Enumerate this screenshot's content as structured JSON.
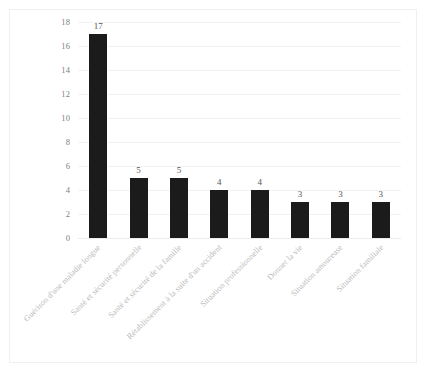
{
  "chart_data": {
    "type": "bar",
    "title": "",
    "subtitle": "",
    "xlabel": "",
    "ylabel": "",
    "ylim": [
      0,
      18
    ],
    "ytick_step": 2,
    "grid": true,
    "legend": false,
    "legend_position": "none",
    "bar_color": "#1b1b1b",
    "gridline_color": "#f2f2f2",
    "tick_label_color": "#808080",
    "category_label_color": "#b9b9b9",
    "category_label_rotation": -45,
    "value_labels_shown": true,
    "categories": [
      "Guérison d'une maladie longue",
      "Santé et sécurité personnelle",
      "Santé et sécurité de la famille",
      "Rétablissement à la suite d'un accident",
      "Situation professionnelle",
      "Donner la vie",
      "Situation amoureuse",
      "Situation familiale"
    ],
    "values": [
      17,
      5,
      5,
      4,
      4,
      3,
      3,
      3
    ],
    "yticks": [
      0,
      2,
      4,
      6,
      8,
      10,
      12,
      14,
      16,
      18
    ],
    "ytick_labels": [
      "0",
      "2",
      "4",
      "6",
      "8",
      "10",
      "12",
      "14",
      "16",
      "18"
    ],
    "value_labels": [
      "17",
      "5",
      "5",
      "4",
      "4",
      "3",
      "3",
      "3"
    ]
  },
  "page": {
    "bottom_bleed_text": ""
  }
}
